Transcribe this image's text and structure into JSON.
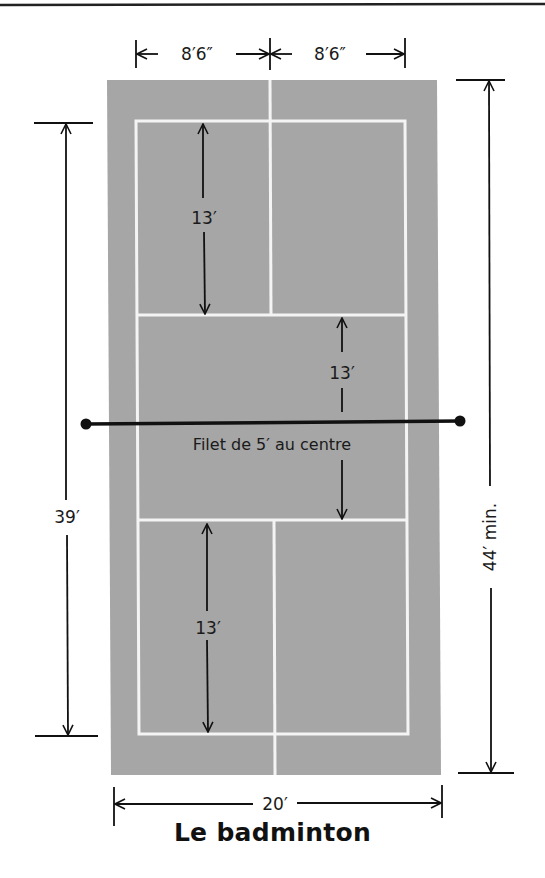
{
  "title": "Le badminton",
  "colors": {
    "court": "#a6a6a6",
    "lines": "#f4f4f4",
    "ink": "#111111",
    "background": "#ffffff"
  },
  "labels": {
    "half_width_left": "8′6″",
    "half_width_right": "8′6″",
    "total_width": "20′",
    "inner_length": "39′",
    "total_length": "44′ min.",
    "zone_top": "13′",
    "zone_middle": "13′",
    "zone_bottom": "13′",
    "net": "Filet de 5′ au centre"
  }
}
